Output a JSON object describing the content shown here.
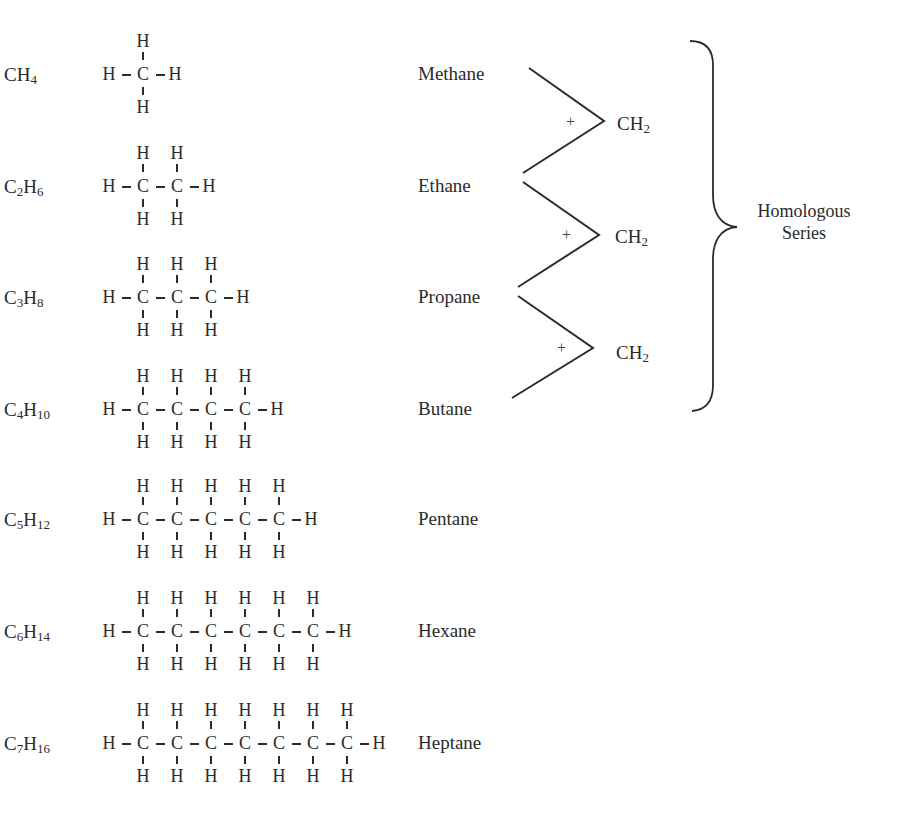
{
  "bracket_label": [
    "Homologous",
    "Series"
  ],
  "increment": {
    "plus": "+",
    "group": "CH",
    "group_sub": "2"
  },
  "rows": [
    {
      "carbons": 1,
      "formula": {
        "c": "C",
        "csub": "",
        "h": "H",
        "hsub": "4"
      },
      "name": "Methane"
    },
    {
      "carbons": 2,
      "formula": {
        "c": "C",
        "csub": "2",
        "h": "H",
        "hsub": "6"
      },
      "name": "Ethane"
    },
    {
      "carbons": 3,
      "formula": {
        "c": "C",
        "csub": "3",
        "h": "H",
        "hsub": "8"
      },
      "name": "Propane"
    },
    {
      "carbons": 4,
      "formula": {
        "c": "C",
        "csub": "4",
        "h": "H",
        "hsub": "10"
      },
      "name": "Butane"
    },
    {
      "carbons": 5,
      "formula": {
        "c": "C",
        "csub": "5",
        "h": "H",
        "hsub": "12"
      },
      "name": "Pentane"
    },
    {
      "carbons": 6,
      "formula": {
        "c": "C",
        "csub": "6",
        "h": "H",
        "hsub": "14"
      },
      "name": "Hexane"
    },
    {
      "carbons": 7,
      "formula": {
        "c": "C",
        "csub": "7",
        "h": "H",
        "hsub": "16"
      },
      "name": "Heptane"
    }
  ],
  "atoms": {
    "carbon": "C",
    "hydrogen": "H"
  },
  "colors": {
    "ink": "#2b2b2b",
    "background": "#ffffff"
  }
}
